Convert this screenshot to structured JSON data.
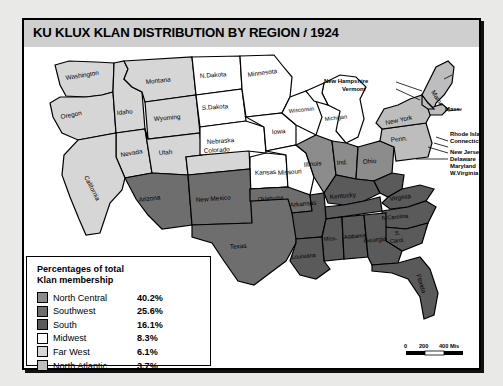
{
  "title": "KU KLUX KLAN DISTRIBUTION BY REGION / 1924",
  "legend": {
    "heading_line1": "Percentages of total",
    "heading_line2": "Klan membership",
    "items": [
      {
        "label": "North Central",
        "value": "40.2%",
        "color": "#8c8c8c"
      },
      {
        "label": "Southwest",
        "value": "25.6%",
        "color": "#6e6e6e"
      },
      {
        "label": "South",
        "value": "16.1%",
        "color": "#5a5a5a"
      },
      {
        "label": "Midwest",
        "value": "8.3%",
        "color": "#ffffff"
      },
      {
        "label": "Far West",
        "value": "6.1%",
        "color": "#d6d6d6"
      },
      {
        "label": "North Atlantic",
        "value": "3.7%",
        "color": "#bdbdbd"
      }
    ]
  },
  "scale": {
    "zero": "0",
    "mid": "200",
    "max": "400 Mis"
  },
  "map": {
    "states": [
      {
        "name": "Washington",
        "region": "Far West"
      },
      {
        "name": "Oregon",
        "region": "Far West"
      },
      {
        "name": "Idaho",
        "region": "Far West"
      },
      {
        "name": "Montana",
        "region": "Far West"
      },
      {
        "name": "Wyoming",
        "region": "Far West"
      },
      {
        "name": "Nevada",
        "region": "Far West"
      },
      {
        "name": "California",
        "region": "Far West"
      },
      {
        "name": "Utah",
        "region": "Far West"
      },
      {
        "name": "Colorado",
        "region": "Far West"
      },
      {
        "name": "Arizona",
        "region": "Southwest"
      },
      {
        "name": "New Mexico",
        "region": "Southwest"
      },
      {
        "name": "Texas",
        "region": "Southwest"
      },
      {
        "name": "Oklahoma",
        "region": "Southwest"
      },
      {
        "name": "N.Dakota",
        "region": "Midwest"
      },
      {
        "name": "S.Dakota",
        "region": "Midwest"
      },
      {
        "name": "Nebraska",
        "region": "Midwest"
      },
      {
        "name": "Kansas",
        "region": "Midwest"
      },
      {
        "name": "Minnesota",
        "region": "Midwest"
      },
      {
        "name": "Iowa",
        "region": "Midwest"
      },
      {
        "name": "Missouri",
        "region": "Midwest"
      },
      {
        "name": "Wisconsin",
        "region": "Midwest"
      },
      {
        "name": "Michigan",
        "region": "Midwest"
      },
      {
        "name": "Illinois",
        "region": "North Central"
      },
      {
        "name": "Ind.",
        "region": "North Central"
      },
      {
        "name": "Ohio",
        "region": "North Central"
      },
      {
        "name": "Kentucky",
        "region": "South"
      },
      {
        "name": "Virginia",
        "region": "South"
      },
      {
        "name": "N.Carolina",
        "region": "South"
      },
      {
        "name": "S.Carol.",
        "region": "South"
      },
      {
        "name": "Georgia",
        "region": "South"
      },
      {
        "name": "Florida",
        "region": "South"
      },
      {
        "name": "Arkansas",
        "region": "South"
      },
      {
        "name": "Miss.",
        "region": "South"
      },
      {
        "name": "Alabama",
        "region": "South"
      },
      {
        "name": "Louisiana",
        "region": "South"
      },
      {
        "name": "Tenn.",
        "region": "South"
      },
      {
        "name": "Penn.",
        "region": "North Atlantic"
      },
      {
        "name": "New York",
        "region": "North Atlantic"
      },
      {
        "name": "Maine",
        "region": "North Atlantic"
      },
      {
        "name": "Mass.",
        "region": "North Atlantic"
      }
    ],
    "callouts": [
      {
        "lines": [
          "New Hampshire",
          "Vermont"
        ]
      },
      {
        "lines": [
          "Mass."
        ]
      },
      {
        "lines": [
          "Rhode Island",
          "Connecticut"
        ]
      },
      {
        "lines": [
          "New Jersey",
          "Delaware",
          "Maryland",
          "W.Virginia"
        ]
      }
    ]
  }
}
